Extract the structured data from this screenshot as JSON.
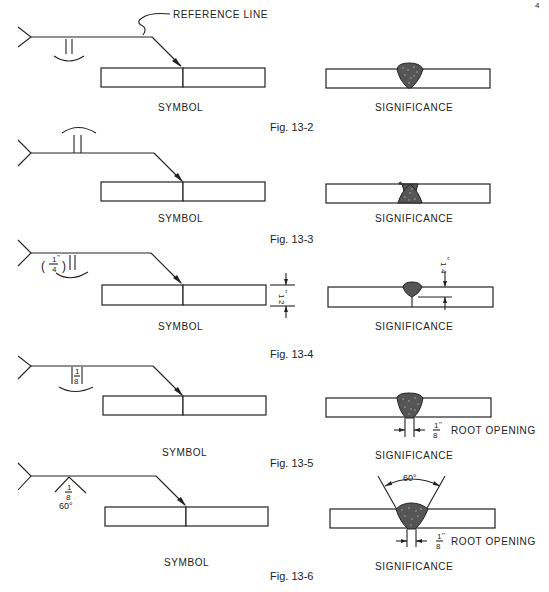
{
  "page_number": "4",
  "labels": {
    "symbol": "SYMBOL",
    "significance": "SIGNIFICANCE",
    "reference_line": "REFERENCE LINE",
    "root_opening": "ROOT OPENING"
  },
  "figures": [
    {
      "id": "fig-13-2",
      "caption": "Fig. 13-2",
      "symbol_side": "arrow side (below)",
      "weld": "square groove, convex contour"
    },
    {
      "id": "fig-13-3",
      "caption": "Fig. 13-3",
      "symbol_side": "other side (above)",
      "weld": "square groove, convex contour"
    },
    {
      "id": "fig-13-4",
      "caption": "Fig. 13-4",
      "weld": "square groove, partial penetration",
      "weld_size": "(1/4\")",
      "plate_thickness": "1/2\"",
      "penetration": "1/4\""
    },
    {
      "id": "fig-13-5",
      "caption": "Fig. 13-5",
      "weld": "square groove with root opening",
      "root_opening_symbol": "1/8",
      "root_opening": "1/8\""
    },
    {
      "id": "fig-13-6",
      "caption": "Fig. 13-6",
      "weld": "V groove",
      "root_opening_symbol": "1/8",
      "groove_angle": "60°",
      "root_opening": "1/8\""
    }
  ],
  "fractions": {
    "quarter_num": "1",
    "quarter_den": "4",
    "half_num": "1",
    "half_den": "2",
    "eighth_num": "1",
    "eighth_den": "8",
    "inch_mark": "\"",
    "angle": "60°"
  }
}
